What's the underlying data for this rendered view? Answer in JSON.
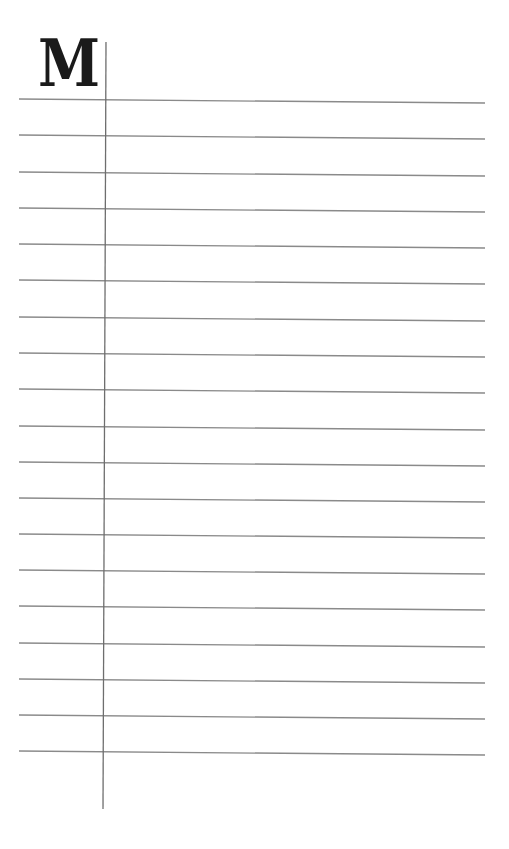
{
  "page": {
    "type": "lined notebook page",
    "initial_letter": "M",
    "line_color": "#8a8a8a",
    "margin_line_color": "#6e6e6e",
    "ruled_line_count": 19,
    "ruled_lines_y_left": [
      99,
      135,
      172,
      208,
      244,
      280,
      317,
      353,
      389,
      426,
      462,
      498,
      534,
      570,
      606,
      643,
      679,
      715,
      751
    ],
    "line_slope_px": 4,
    "line_x_start": 19,
    "line_x_end": 485,
    "margin_line": {
      "x_top": 106,
      "x_bottom": 103,
      "y_top": 42,
      "y_bottom": 809
    }
  }
}
